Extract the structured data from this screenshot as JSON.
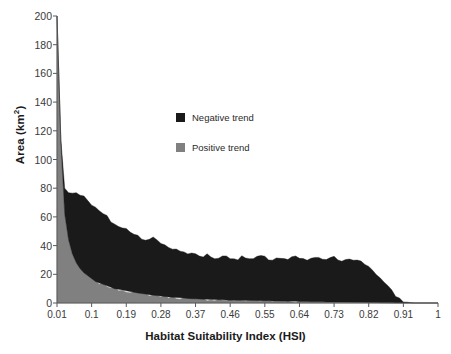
{
  "chart_data": {
    "type": "area",
    "stacked": true,
    "title": "",
    "xlabel": "Habitat Suitability Index (HSI)",
    "ylabel": "Area (km²)",
    "xlim": [
      0.01,
      1.0
    ],
    "ylim": [
      0,
      200
    ],
    "grid": false,
    "legend_position": "inside-upper-center",
    "xticks": [
      "0.01",
      "0.1",
      "0.19",
      "0.28",
      "0.37",
      "0.46",
      "0.55",
      "0.64",
      "0.73",
      "0.82",
      "0.91",
      "1"
    ],
    "xtick_values": [
      0.01,
      0.1,
      0.19,
      0.28,
      0.37,
      0.46,
      0.55,
      0.64,
      0.73,
      0.82,
      0.91,
      1.0
    ],
    "yticks": [
      "0",
      "20",
      "40",
      "60",
      "80",
      "100",
      "120",
      "140",
      "160",
      "180",
      "200"
    ],
    "ytick_values": [
      0,
      20,
      40,
      60,
      80,
      100,
      120,
      140,
      160,
      180,
      200
    ],
    "colors": {
      "negative": "#1a1a1a",
      "positive": "#808080",
      "axis": "#595959",
      "text": "#2a2a2a"
    },
    "x": [
      0.01,
      0.02,
      0.03,
      0.04,
      0.05,
      0.06,
      0.07,
      0.08,
      0.09,
      0.1,
      0.11,
      0.12,
      0.13,
      0.14,
      0.15,
      0.16,
      0.17,
      0.18,
      0.19,
      0.2,
      0.21,
      0.22,
      0.23,
      0.24,
      0.25,
      0.26,
      0.27,
      0.28,
      0.29,
      0.3,
      0.31,
      0.32,
      0.33,
      0.34,
      0.35,
      0.36,
      0.37,
      0.38,
      0.39,
      0.4,
      0.41,
      0.42,
      0.43,
      0.44,
      0.45,
      0.46,
      0.47,
      0.48,
      0.49,
      0.5,
      0.51,
      0.52,
      0.53,
      0.54,
      0.55,
      0.56,
      0.57,
      0.58,
      0.59,
      0.6,
      0.61,
      0.62,
      0.63,
      0.64,
      0.65,
      0.66,
      0.67,
      0.68,
      0.69,
      0.7,
      0.71,
      0.72,
      0.73,
      0.74,
      0.75,
      0.76,
      0.77,
      0.78,
      0.79,
      0.8,
      0.81,
      0.82,
      0.83,
      0.84,
      0.85,
      0.86,
      0.87,
      0.88,
      0.89,
      0.9,
      0.91,
      0.92,
      0.93,
      0.94,
      0.95,
      0.96,
      0.97,
      0.98,
      0.99,
      1.0
    ],
    "series": [
      {
        "name": "Positive trend",
        "color": "#808080",
        "values": [
          200,
          112,
          62,
          44,
          34,
          28,
          24,
          21,
          19,
          17,
          15,
          14,
          13,
          12,
          11,
          10,
          9.5,
          9,
          8.5,
          8,
          7.5,
          7,
          6.6,
          6.2,
          5.8,
          5.4,
          5.1,
          4.8,
          4.5,
          4.2,
          4.0,
          3.8,
          3.6,
          3.4,
          3.2,
          3.0,
          2.9,
          2.8,
          2.7,
          2.6,
          2.5,
          2.4,
          2.3,
          2.2,
          2.1,
          2.0,
          1.95,
          1.9,
          1.85,
          1.8,
          1.75,
          1.7,
          1.65,
          1.6,
          1.55,
          1.5,
          1.45,
          1.4,
          1.35,
          1.3,
          1.25,
          1.2,
          1.15,
          1.1,
          1.05,
          1.0,
          0.95,
          0.9,
          0.85,
          0.8,
          0.78,
          0.75,
          0.72,
          0.7,
          0.68,
          0.65,
          0.62,
          0.6,
          0.55,
          0.5,
          0.45,
          0.4,
          0.35,
          0.3,
          0.25,
          0.2,
          0.15,
          0.1,
          0.06,
          0.03,
          0.01,
          0,
          0,
          0,
          0,
          0,
          0,
          0,
          0,
          0
        ]
      },
      {
        "name": "Negative trend",
        "color": "#1a1a1a",
        "values": [
          0,
          2,
          18,
          33,
          43,
          49,
          52,
          53,
          53,
          52,
          51,
          50,
          49,
          48,
          46,
          45,
          44,
          43,
          43,
          42,
          41,
          40,
          39,
          38,
          38,
          40,
          39,
          37,
          36,
          35,
          34,
          33,
          33,
          32,
          32,
          31,
          31,
          30,
          30,
          31,
          30,
          29,
          29,
          30,
          31,
          30,
          29,
          29,
          30,
          30,
          29,
          29,
          30,
          31,
          30,
          29,
          29,
          30,
          30,
          29,
          29,
          30,
          31,
          30,
          29,
          29,
          30,
          30,
          31,
          30,
          29,
          30,
          31,
          30,
          29,
          30,
          31,
          30,
          29,
          28,
          27,
          25,
          23,
          20,
          17,
          14,
          11,
          8,
          5,
          3,
          1.5,
          0.6,
          0.2,
          0,
          0,
          0,
          0,
          0,
          0,
          0
        ]
      }
    ]
  },
  "legend": {
    "items": [
      {
        "label": "Negative trend",
        "color": "#1a1a1a"
      },
      {
        "label": "Positive trend",
        "color": "#808080"
      }
    ]
  }
}
